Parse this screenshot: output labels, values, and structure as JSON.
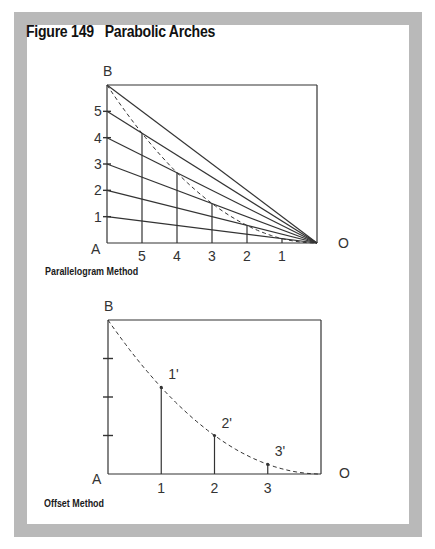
{
  "figure": {
    "title": "Figure 149   Parabolic Arches"
  },
  "parallelogram": {
    "caption": "Parallelogram Method",
    "point_labels": {
      "top_left": "B",
      "bottom_left": "A",
      "bottom_right": "O"
    },
    "left_divisions": [
      "1",
      "2",
      "3",
      "4",
      "5"
    ],
    "bottom_divisions": [
      "5",
      "4",
      "3",
      "2",
      "1"
    ],
    "divisions": 6
  },
  "offset": {
    "caption": "Offset Method",
    "point_labels": {
      "top_left": "B",
      "bottom_left": "A",
      "bottom_right": "O"
    },
    "bottom_divisions": [
      "1",
      "2",
      "3"
    ],
    "offset_labels": [
      "1'",
      "2'",
      "3'"
    ],
    "divisions": 4
  },
  "colors": {
    "frame": "#b9b9b9",
    "line": "#333333"
  }
}
